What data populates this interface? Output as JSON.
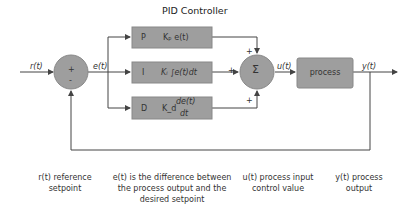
{
  "title": "PID Controller",
  "signals": {
    "reference": "r(t)",
    "error": "e(t)",
    "control": "u(t)",
    "output": "y(t)"
  },
  "summing_junction_1": {
    "plus": "+",
    "minus": "-"
  },
  "summing_junction_2": {
    "symbol": "Σ",
    "signs": [
      "+",
      "+",
      "+"
    ]
  },
  "blocks": [
    {
      "letter": "P",
      "formula": "Kₚ e(t)"
    },
    {
      "letter": "I",
      "formula": "Kᵢ ∫e(t)dt"
    },
    {
      "letter": "D",
      "gain": "K_d",
      "formula_num": "de(t)",
      "formula_den": "dt"
    }
  ],
  "process": {
    "label": "process"
  },
  "legend": [
    {
      "text": "r(t) reference setpoint"
    },
    {
      "text": "e(t) is the difference between the process output and the desired setpoint"
    },
    {
      "text": "u(t) process input control value"
    },
    {
      "text": "y(t) process output"
    }
  ],
  "colors": {
    "block_fill": "#9e9e9e",
    "line": "#444444",
    "text": "#333333"
  }
}
